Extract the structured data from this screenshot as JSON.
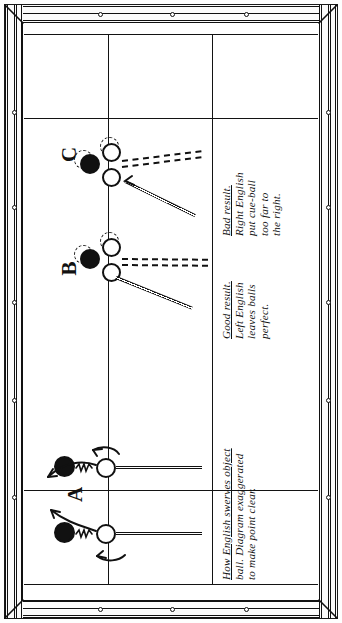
{
  "figure": {
    "kind": "billiard-table-diagram",
    "orientation": "rotated-90",
    "ink_color": "#111111",
    "cloth_color": "#ffffff"
  },
  "labels": [
    {
      "id": "A",
      "text": "A"
    },
    {
      "id": "B",
      "text": "B"
    },
    {
      "id": "C",
      "text": "C"
    }
  ],
  "captions": [
    {
      "id": "caption-c",
      "lines": [
        "Bad result.",
        "Right English",
        "put cue-ball",
        "too far to",
        "the right."
      ]
    },
    {
      "id": "caption-b",
      "lines": [
        "Good result.",
        "Left English",
        "leaves balls",
        "perfect."
      ]
    },
    {
      "id": "caption-a",
      "lines": [
        "How English swerves object",
        "ball.  Diagram exaggerated",
        "to make point clear."
      ]
    }
  ],
  "shots": [
    {
      "id": "shot-c",
      "label": "C",
      "object_ball": "black",
      "cue_ball": "white",
      "ghost_balls": 2,
      "cue_stick": true,
      "dashed_path": true,
      "result": "bad"
    },
    {
      "id": "shot-b",
      "label": "B",
      "object_ball": "black",
      "cue_ball": "white",
      "ghost_balls": 2,
      "cue_stick": true,
      "dashed_path": true,
      "result": "good"
    },
    {
      "id": "shot-a-upper",
      "label": "A",
      "object_ball": "black",
      "cue_ball": "white",
      "ghost_balls": 0,
      "cue_stick": true,
      "swerve_arrow": true,
      "spin_arrow": "top",
      "result": "swerve"
    },
    {
      "id": "shot-a-lower",
      "label": "",
      "object_ball": "black",
      "cue_ball": "white",
      "ghost_balls": 0,
      "cue_stick": true,
      "swerve_arrow": true,
      "spin_arrow": "bottom",
      "result": "swerve"
    }
  ]
}
